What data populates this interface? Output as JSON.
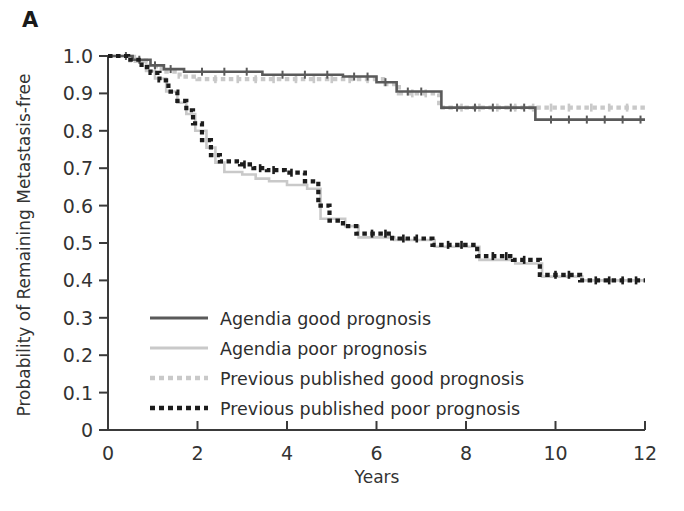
{
  "figure": {
    "panel_letter": "A",
    "background": "#ffffff"
  },
  "axes": {
    "x_title": "Years",
    "y_title": "Probability of Remaining Metastasis-free",
    "x_ticks": [
      "0",
      "2",
      "4",
      "6",
      "8",
      "10",
      "12"
    ],
    "y_ticks": [
      "0",
      "0.1",
      "0.2",
      "0.3",
      "0.4",
      "0.5",
      "0.6",
      "0.7",
      "0.8",
      "0.9",
      "1.0"
    ]
  },
  "legend": {
    "items": [
      {
        "label": "Agendia good prognosis",
        "color": "#5a5a5a",
        "style": "solid"
      },
      {
        "label": "Agendia poor prognosis",
        "color": "#c9c9c9",
        "style": "solid"
      },
      {
        "label": "Previous published good prognosis",
        "color": "#c9c9c9",
        "style": "dotted"
      },
      {
        "label": "Previous published poor prognosis",
        "color": "#1c1c1c",
        "style": "dotted"
      }
    ]
  },
  "chart_data": {
    "type": "line",
    "title": "",
    "subtitle": "",
    "xlabel": "Years",
    "ylabel": "Probability of Remaining Metastasis-free",
    "xlim": [
      0,
      12
    ],
    "ylim": [
      0,
      1.0
    ],
    "xticks": [
      0,
      2,
      4,
      6,
      8,
      10,
      12
    ],
    "yticks": [
      0,
      0.1,
      0.2,
      0.3,
      0.4,
      0.5,
      0.6,
      0.7,
      0.8,
      0.9,
      1.0
    ],
    "grid": false,
    "legend_position": "lower-left-inside",
    "curve_style": "kaplan-meier step function with censoring tick marks",
    "series": [
      {
        "name": "Agendia good prognosis",
        "color": "#5a5a5a",
        "style": "solid",
        "points": [
          [
            0.0,
            1.0
          ],
          [
            0.55,
            1.0
          ],
          [
            0.55,
            0.99
          ],
          [
            0.95,
            0.99
          ],
          [
            0.95,
            0.975
          ],
          [
            1.25,
            0.975
          ],
          [
            1.25,
            0.965
          ],
          [
            1.7,
            0.965
          ],
          [
            1.7,
            0.958
          ],
          [
            3.45,
            0.958
          ],
          [
            3.45,
            0.95
          ],
          [
            5.25,
            0.95
          ],
          [
            5.25,
            0.945
          ],
          [
            6.0,
            0.945
          ],
          [
            6.0,
            0.93
          ],
          [
            6.45,
            0.93
          ],
          [
            6.45,
            0.905
          ],
          [
            7.45,
            0.905
          ],
          [
            7.45,
            0.862
          ],
          [
            9.55,
            0.862
          ],
          [
            9.55,
            0.83
          ],
          [
            12.0,
            0.83
          ]
        ],
        "censor_marks": [
          0.4,
          0.7,
          1.05,
          1.4,
          2.1,
          2.6,
          3.1,
          3.9,
          4.4,
          4.9,
          5.5,
          5.8,
          6.2,
          6.7,
          7.0,
          7.8,
          8.2,
          8.6,
          9.0,
          9.3,
          9.9,
          10.3,
          10.7,
          11.1,
          11.5,
          11.9
        ]
      },
      {
        "name": "Agendia poor prognosis",
        "color": "#c9c9c9",
        "style": "solid",
        "points": [
          [
            0.0,
            1.0
          ],
          [
            0.6,
            1.0
          ],
          [
            0.6,
            0.985
          ],
          [
            0.85,
            0.985
          ],
          [
            0.85,
            0.96
          ],
          [
            1.05,
            0.96
          ],
          [
            1.05,
            0.94
          ],
          [
            1.3,
            0.94
          ],
          [
            1.3,
            0.905
          ],
          [
            1.55,
            0.905
          ],
          [
            1.55,
            0.875
          ],
          [
            1.75,
            0.875
          ],
          [
            1.75,
            0.845
          ],
          [
            1.95,
            0.845
          ],
          [
            1.95,
            0.8
          ],
          [
            2.2,
            0.8
          ],
          [
            2.2,
            0.755
          ],
          [
            2.4,
            0.755
          ],
          [
            2.4,
            0.715
          ],
          [
            2.6,
            0.715
          ],
          [
            2.6,
            0.69
          ],
          [
            3.0,
            0.69
          ],
          [
            3.0,
            0.683
          ],
          [
            3.3,
            0.683
          ],
          [
            3.3,
            0.672
          ],
          [
            3.6,
            0.672
          ],
          [
            3.6,
            0.665
          ],
          [
            4.0,
            0.665
          ],
          [
            4.0,
            0.655
          ],
          [
            4.45,
            0.655
          ],
          [
            4.45,
            0.645
          ],
          [
            4.75,
            0.645
          ],
          [
            4.75,
            0.565
          ],
          [
            5.3,
            0.565
          ],
          [
            5.3,
            0.545
          ],
          [
            5.6,
            0.545
          ],
          [
            5.6,
            0.515
          ],
          [
            6.4,
            0.515
          ],
          [
            6.4,
            0.508
          ],
          [
            7.3,
            0.508
          ],
          [
            7.3,
            0.49
          ],
          [
            8.3,
            0.49
          ],
          [
            8.3,
            0.455
          ],
          [
            9.1,
            0.455
          ],
          [
            9.1,
            0.445
          ],
          [
            9.7,
            0.445
          ],
          [
            9.7,
            0.41
          ],
          [
            10.6,
            0.41
          ],
          [
            10.6,
            0.4
          ],
          [
            12.0,
            0.4
          ]
        ],
        "censor_marks": []
      },
      {
        "name": "Previous published good prognosis",
        "color": "#c9c9c9",
        "style": "dotted",
        "points": [
          [
            0.0,
            1.0
          ],
          [
            0.5,
            1.0
          ],
          [
            0.5,
            0.988
          ],
          [
            0.9,
            0.988
          ],
          [
            0.9,
            0.972
          ],
          [
            1.2,
            0.972
          ],
          [
            1.2,
            0.958
          ],
          [
            1.6,
            0.958
          ],
          [
            1.6,
            0.945
          ],
          [
            2.0,
            0.945
          ],
          [
            2.0,
            0.938
          ],
          [
            6.2,
            0.938
          ],
          [
            6.2,
            0.925
          ],
          [
            6.5,
            0.925
          ],
          [
            6.5,
            0.9
          ],
          [
            7.4,
            0.9
          ],
          [
            7.4,
            0.862
          ],
          [
            12.0,
            0.862
          ]
        ],
        "censor_marks": [
          2.4,
          2.9,
          3.3,
          3.7,
          4.2,
          4.6,
          5.0,
          5.4,
          5.8,
          6.8,
          7.1,
          7.9,
          8.3,
          8.7,
          9.1,
          9.5,
          9.9,
          10.3,
          10.8,
          11.2,
          11.6
        ]
      },
      {
        "name": "Previous published poor prognosis",
        "color": "#1c1c1c",
        "style": "dotted",
        "points": [
          [
            0.0,
            1.0
          ],
          [
            0.45,
            1.0
          ],
          [
            0.45,
            0.99
          ],
          [
            0.75,
            0.99
          ],
          [
            0.75,
            0.97
          ],
          [
            0.95,
            0.97
          ],
          [
            0.95,
            0.955
          ],
          [
            1.15,
            0.955
          ],
          [
            1.15,
            0.935
          ],
          [
            1.35,
            0.935
          ],
          [
            1.35,
            0.905
          ],
          [
            1.55,
            0.905
          ],
          [
            1.55,
            0.88
          ],
          [
            1.75,
            0.88
          ],
          [
            1.75,
            0.855
          ],
          [
            1.9,
            0.855
          ],
          [
            1.9,
            0.82
          ],
          [
            2.1,
            0.82
          ],
          [
            2.1,
            0.775
          ],
          [
            2.3,
            0.775
          ],
          [
            2.3,
            0.735
          ],
          [
            2.5,
            0.735
          ],
          [
            2.5,
            0.718
          ],
          [
            2.95,
            0.718
          ],
          [
            2.95,
            0.71
          ],
          [
            3.25,
            0.71
          ],
          [
            3.25,
            0.7
          ],
          [
            3.55,
            0.7
          ],
          [
            3.55,
            0.695
          ],
          [
            3.95,
            0.695
          ],
          [
            3.95,
            0.688
          ],
          [
            4.4,
            0.688
          ],
          [
            4.4,
            0.665
          ],
          [
            4.7,
            0.665
          ],
          [
            4.7,
            0.6
          ],
          [
            4.95,
            0.6
          ],
          [
            4.95,
            0.56
          ],
          [
            5.25,
            0.56
          ],
          [
            5.25,
            0.545
          ],
          [
            5.55,
            0.545
          ],
          [
            5.55,
            0.525
          ],
          [
            6.35,
            0.525
          ],
          [
            6.35,
            0.512
          ],
          [
            7.25,
            0.512
          ],
          [
            7.25,
            0.495
          ],
          [
            8.25,
            0.495
          ],
          [
            8.25,
            0.465
          ],
          [
            9.05,
            0.465
          ],
          [
            9.05,
            0.455
          ],
          [
            9.65,
            0.455
          ],
          [
            9.65,
            0.415
          ],
          [
            10.55,
            0.415
          ],
          [
            10.55,
            0.4
          ],
          [
            12.0,
            0.4
          ]
        ],
        "censor_marks": [
          3.05,
          3.4,
          3.7,
          4.1,
          5.9,
          6.2,
          6.6,
          6.9,
          7.6,
          7.9,
          8.6,
          8.9,
          9.3,
          10.0,
          10.3,
          10.9,
          11.2,
          11.5,
          11.8
        ]
      }
    ]
  }
}
